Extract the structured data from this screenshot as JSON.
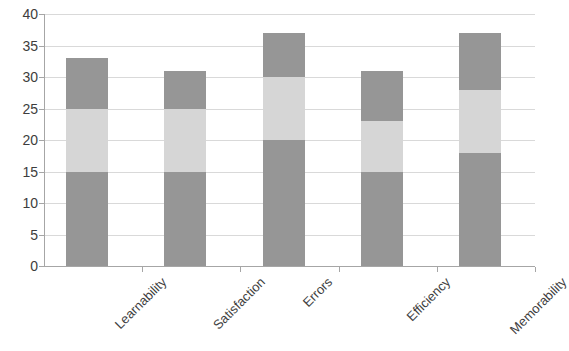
{
  "chart_data": {
    "type": "bar",
    "stacked": true,
    "title": "",
    "subtitle": "",
    "xlabel": "",
    "ylabel": "",
    "ylim": [
      0,
      40
    ],
    "ytick_step": 5,
    "yticks": [
      "40",
      "35",
      "30",
      "25",
      "20",
      "15",
      "10",
      "5",
      "0"
    ],
    "grid": true,
    "legend": false,
    "legend_position": "none",
    "categories": [
      "Learnability",
      "Satisfaction",
      "Errors",
      "Efficiency",
      "Memorability"
    ],
    "series": [
      {
        "name": "Series 1",
        "color": "#969696",
        "values": [
          15,
          15,
          20,
          15,
          18
        ]
      },
      {
        "name": "Series 2",
        "color": "#d6d6d6",
        "values": [
          10,
          10,
          10,
          8,
          10
        ]
      },
      {
        "name": "Series 3",
        "color": "#969696",
        "values": [
          8,
          6,
          7,
          8,
          9
        ]
      }
    ],
    "totals": [
      33,
      31,
      37,
      31,
      37
    ]
  },
  "colors": {
    "series_dark": "#969696",
    "series_light": "#d6d6d6",
    "gridline": "#d9d9d9",
    "axis": "#a6a6a6",
    "text": "#3d3d3d",
    "background": "#ffffff"
  }
}
